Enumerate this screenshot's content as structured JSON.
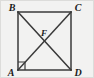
{
  "figure": {
    "background_color": "#f2f2f1",
    "stroke_color": "#3a3a3a",
    "label_color": "#1b1b1b",
    "width": 94,
    "height": 78,
    "square": {
      "left": 18,
      "top": 12,
      "right": 71,
      "bottom": 70
    },
    "vertices": [
      {
        "id": "B",
        "label": "B",
        "role": "top-left",
        "x": 18,
        "y": 12,
        "label_x": 12,
        "label_y": 11
      },
      {
        "id": "C",
        "label": "C",
        "role": "top-right",
        "x": 71,
        "y": 12,
        "label_x": 74,
        "label_y": 11
      },
      {
        "id": "A",
        "label": "A",
        "role": "bottom-left",
        "x": 18,
        "y": 70,
        "label_x": 12,
        "label_y": 76
      },
      {
        "id": "D",
        "label": "D",
        "role": "bottom-right",
        "x": 71,
        "y": 70,
        "label_x": 74,
        "label_y": 76
      }
    ],
    "intersection": {
      "id": "F",
      "label": "F",
      "x": 44.5,
      "y": 41,
      "label_x": 44,
      "label_y": 35
    },
    "edges": [
      {
        "name": "BC",
        "from": "B",
        "to": "C"
      },
      {
        "name": "CD",
        "from": "C",
        "to": "D"
      },
      {
        "name": "DA",
        "from": "D",
        "to": "A"
      },
      {
        "name": "AB",
        "from": "A",
        "to": "B"
      }
    ],
    "diagonals": [
      {
        "name": "AC",
        "from": "A",
        "to": "C"
      },
      {
        "name": "BD",
        "from": "B",
        "to": "D"
      }
    ],
    "right_angle_marker": {
      "at_vertex": "A",
      "between": "AB and AC",
      "points": "18,62 25,62 25,70"
    }
  }
}
